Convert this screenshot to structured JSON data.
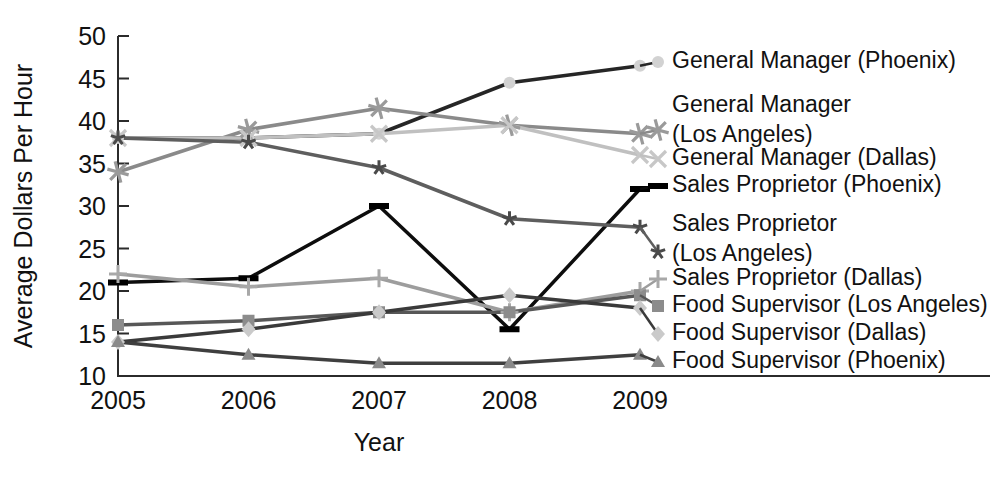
{
  "chart_data": {
    "type": "line",
    "title": "",
    "xlabel": "Year",
    "ylabel": "Average Dollars Per Hour",
    "categories": [
      "2005",
      "2006",
      "2007",
      "2008",
      "2009"
    ],
    "x": [
      2005,
      2006,
      2007,
      2008,
      2009
    ],
    "ylim": [
      10,
      50
    ],
    "xlim": [
      2005,
      2009
    ],
    "yticks": [
      "10",
      "15",
      "20",
      "25",
      "30",
      "35",
      "40",
      "45",
      "50"
    ],
    "ytick_values": [
      10,
      15,
      20,
      25,
      30,
      35,
      40,
      45,
      50
    ],
    "grid": false,
    "legend_position": "right",
    "series": [
      {
        "name": "General Manager (Phoenix)",
        "values": [
          38,
          38,
          38.5,
          44.5,
          46.5
        ],
        "color": "#262626",
        "marker": "circle",
        "marker_color": "#d2d2d2",
        "line_width": 3.5
      },
      {
        "name": "General Manager (Los Angeles)",
        "label_lines": [
          "General Manager",
          "(Los Angeles)"
        ],
        "values": [
          34,
          39,
          41.5,
          39.5,
          38.5
        ],
        "color": "#8a8a8a",
        "marker": "asterisk",
        "marker_color": "#9a9a9a",
        "line_width": 3.5
      },
      {
        "name": "General Manager (Dallas)",
        "values": [
          38,
          38,
          38.5,
          39.5,
          36
        ],
        "color": "#c0c0c0",
        "marker": "x",
        "marker_color": "#c7c7c7",
        "line_width": 3.5
      },
      {
        "name": "Sales Proprietor (Phoenix)",
        "values": [
          21,
          21.5,
          30,
          15.5,
          32
        ],
        "color": "#0d0d0d",
        "marker": "dash",
        "marker_color": "#000000",
        "line_width": 3.5
      },
      {
        "name": "Sales Proprietor (Los Angeles)",
        "label_lines": [
          "Sales Proprietor",
          "(Los Angeles)"
        ],
        "values": [
          38,
          37.5,
          34.5,
          28.5,
          27.5
        ],
        "color": "#5e5e5e",
        "marker": "star",
        "marker_color": "#4a4a4a",
        "line_width": 3.5
      },
      {
        "name": "Sales Proprietor (Dallas)",
        "values": [
          22,
          20.5,
          21.5,
          17.5,
          20
        ],
        "color": "#9d9d9d",
        "marker": "plus",
        "marker_color": "#a8a8a8",
        "line_width": 3.5
      },
      {
        "name": "Food Supervisor (Los Angeles)",
        "values": [
          16,
          16.5,
          17.5,
          17.5,
          19.5
        ],
        "color": "#575757",
        "marker": "square",
        "marker_color": "#8c8c8c",
        "line_width": 3.5
      },
      {
        "name": "Food Supervisor (Dallas)",
        "values": [
          14,
          15.5,
          17.5,
          19.5,
          18
        ],
        "color": "#3a3a3a",
        "marker": "diamond",
        "marker_color": "#cacaca",
        "line_width": 3.5
      },
      {
        "name": "Food Supervisor (Phoenix)",
        "values": [
          14,
          12.5,
          11.5,
          11.5,
          12.5
        ],
        "color": "#3f3f3f",
        "marker": "triangle",
        "marker_color": "#8a8a8a",
        "line_width": 3.5
      }
    ],
    "legend_entries": [
      {
        "label": "General Manager (Phoenix)",
        "lines": [
          "General Manager (Phoenix)"
        ]
      },
      {
        "label": "General Manager (Los Angeles)",
        "lines": [
          "General Manager",
          "(Los Angeles)"
        ]
      },
      {
        "label": "General Manager (Dallas)",
        "lines": [
          "General Manager (Dallas)"
        ]
      },
      {
        "label": "Sales Proprietor (Phoenix)",
        "lines": [
          "Sales Proprietor (Phoenix)"
        ]
      },
      {
        "label": "Sales Proprietor (Los Angeles)",
        "lines": [
          "Sales Proprietor",
          "(Los Angeles)"
        ]
      },
      {
        "label": "Sales Proprietor (Dallas)",
        "lines": [
          "Sales Proprietor (Dallas)"
        ]
      },
      {
        "label": "Food Supervisor (Los Angeles)",
        "lines": [
          "Food Supervisor (Los Angeles)"
        ]
      },
      {
        "label": "Food Supervisor (Dallas)",
        "lines": [
          "Food Supervisor (Dallas)"
        ]
      },
      {
        "label": "Food Supervisor (Phoenix)",
        "lines": [
          "Food Supervisor (Phoenix)"
        ]
      }
    ]
  },
  "axes": {
    "x_title": "Year",
    "y_title": "Average Dollars Per Hour"
  }
}
